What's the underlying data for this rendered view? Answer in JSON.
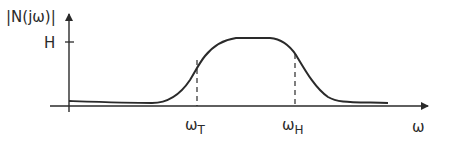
{
  "diagram": {
    "y_axis_label": "|N(jω)|",
    "y_tick_label": "H",
    "x_axis_label": "ω",
    "x_markers": [
      {
        "symbol": "ω",
        "subscript": "T"
      },
      {
        "symbol": "ω",
        "subscript": "H"
      }
    ],
    "colors": {
      "stroke": "#2a2a2a",
      "background": "#ffffff"
    }
  }
}
